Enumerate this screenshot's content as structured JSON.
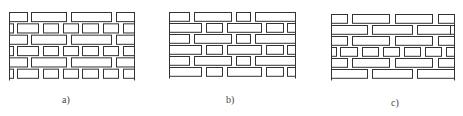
{
  "figure": {
    "stroke_color": "#333333",
    "background": "#ffffff",
    "panels": [
      {
        "id": "a",
        "caption": "a)",
        "bond": "alternating stretcher and header courses",
        "left": 9,
        "top": 12,
        "width": 125,
        "height": 68,
        "caption_x": 62,
        "caption_y": 94,
        "rows": [
          [
            [
              0,
              18
            ],
            [
              22,
              57
            ],
            [
              62,
              102
            ],
            [
              107,
              125
            ]
          ],
          [
            [
              0,
              4
            ],
            [
              8,
              29
            ],
            [
              34,
              49
            ],
            [
              54,
              69
            ],
            [
              73,
              89
            ],
            [
              94,
              109
            ],
            [
              114,
              125
            ]
          ],
          [
            [
              0,
              18
            ],
            [
              22,
              57
            ],
            [
              62,
              102
            ],
            [
              107,
              125
            ]
          ],
          [
            [
              0,
              4
            ],
            [
              8,
              29
            ],
            [
              34,
              49
            ],
            [
              54,
              69
            ],
            [
              73,
              89
            ],
            [
              94,
              109
            ],
            [
              114,
              125
            ]
          ],
          [
            [
              0,
              18
            ],
            [
              22,
              57
            ],
            [
              62,
              102
            ],
            [
              107,
              125
            ]
          ],
          [
            [
              0,
              4
            ],
            [
              8,
              29
            ],
            [
              34,
              49
            ],
            [
              54,
              69
            ],
            [
              73,
              89
            ],
            [
              94,
              109
            ],
            [
              114,
              125
            ]
          ]
        ]
      },
      {
        "id": "b",
        "caption": "b)",
        "bond": "mixed stretcher and header in each course",
        "left": 169,
        "top": 12,
        "width": 126,
        "height": 66,
        "caption_x": 226,
        "caption_y": 94,
        "rows": [
          [
            [
              0,
              20
            ],
            [
              25,
              62
            ],
            [
              67,
              81
            ],
            [
              86,
              126
            ]
          ],
          [
            [
              0,
              32
            ],
            [
              37,
              53
            ],
            [
              58,
              92
            ],
            [
              97,
              114
            ],
            [
              118,
              126
            ]
          ],
          [
            [
              0,
              20
            ],
            [
              25,
              62
            ],
            [
              67,
              81
            ],
            [
              86,
              126
            ]
          ],
          [
            [
              0,
              32
            ],
            [
              37,
              53
            ],
            [
              58,
              92
            ],
            [
              97,
              114
            ],
            [
              118,
              126
            ]
          ],
          [
            [
              0,
              20
            ],
            [
              25,
              62
            ],
            [
              67,
              81
            ],
            [
              86,
              126
            ]
          ],
          [
            [
              0,
              32
            ],
            [
              37,
              53
            ],
            [
              58,
              92
            ],
            [
              97,
              114
            ],
            [
              118,
              126
            ]
          ]
        ]
      },
      {
        "id": "c",
        "caption": "c)",
        "bond": "multiple stretcher courses with one header course",
        "left": 331,
        "top": 14,
        "width": 123,
        "height": 66,
        "caption_x": 391,
        "caption_y": 97,
        "rows": [
          [
            [
              0,
              16
            ],
            [
              21,
              58
            ],
            [
              64,
              101
            ],
            [
              107,
              123
            ]
          ],
          [
            [
              0,
              36
            ],
            [
              41,
              81
            ],
            [
              86,
              120
            ],
            [
              119,
              123
            ]
          ],
          [
            [
              0,
              16
            ],
            [
              21,
              58
            ],
            [
              64,
              101
            ],
            [
              107,
              123
            ]
          ],
          [
            [
              0,
              5
            ],
            [
              9,
              26
            ],
            [
              31,
              47
            ],
            [
              52,
              68
            ],
            [
              73,
              89
            ],
            [
              94,
              110
            ],
            [
              115,
              123
            ]
          ],
          [
            [
              0,
              16
            ],
            [
              21,
              58
            ],
            [
              64,
              101
            ],
            [
              107,
              123
            ]
          ],
          [
            [
              0,
              36
            ],
            [
              41,
              81
            ],
            [
              86,
              123
            ]
          ]
        ]
      }
    ]
  }
}
